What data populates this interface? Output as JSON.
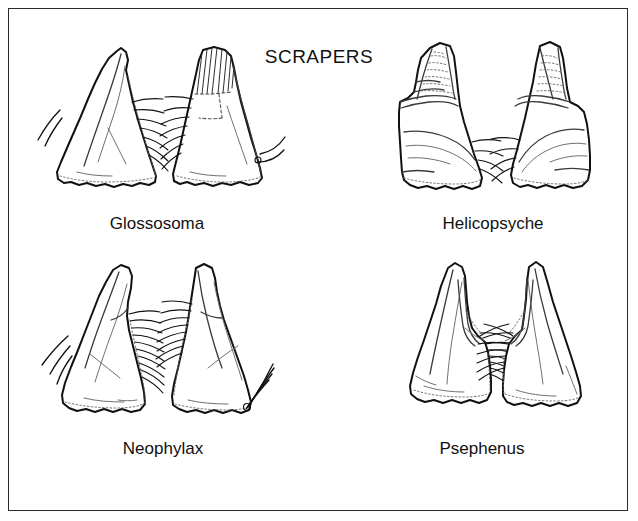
{
  "figure": {
    "title": "SCRAPERS",
    "border_color": "#2a2a2a",
    "background_color": "#ffffff",
    "ink_color": "#111111",
    "type": "scientific-line-illustration"
  },
  "panels": [
    {
      "id": "glossosoma",
      "label": "Glossosoma",
      "position": "top-left",
      "specimen_count": 2,
      "features": [
        "paired triangular mandibles facing each other",
        "vertical hatching on right mandible apex",
        "dashed internal boundary line",
        "fringe of setae along the facing inner margins",
        "long curved seta at outer lower margin of each mandible",
        "irregular scalloped basal edge"
      ]
    },
    {
      "id": "helicopsyche",
      "label": "Helicopsyche",
      "position": "top-right",
      "specimen_count": 2,
      "features": [
        "paired mandibles with stippled apical region",
        "distinct transverse division separating apex from base",
        "broad rounded basal portion",
        "tuft of setae on inner margin",
        "irregular lobed basal edge"
      ]
    },
    {
      "id": "neophylax",
      "label": "Neophylax",
      "position": "bottom-left",
      "specimen_count": 2,
      "features": [
        "narrow hooked apex",
        "dense brush of setae along the inner margin",
        "long curved setae emerging from the lower corner",
        "internal ridge line running from apex to base"
      ]
    },
    {
      "id": "psephenus",
      "label": "Psephenus",
      "position": "bottom-right",
      "specimen_count": 2,
      "features": [
        "tall sharply pointed triangular mandibles",
        "prominent internal ridge parallel to inner margin",
        "dense setal brush at mid inner margin",
        "wavy irregular basal edge"
      ]
    }
  ]
}
